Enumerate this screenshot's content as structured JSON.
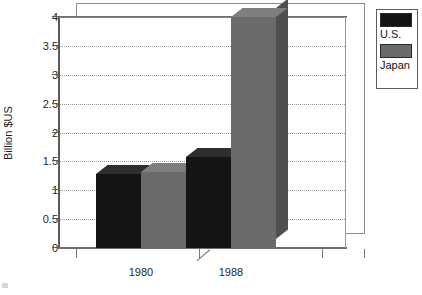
{
  "chart_data": {
    "type": "bar",
    "title": "",
    "subtitle": "",
    "xlabel": "",
    "ylabel": "Billion $US",
    "categories": [
      "1980",
      "1988"
    ],
    "series": [
      {
        "name": "U.S.",
        "color": "#141414",
        "values": [
          1.28,
          1.57
        ]
      },
      {
        "name": "Japan",
        "color": "#6b6b6b",
        "values": [
          1.32,
          4.0
        ]
      }
    ],
    "ylim": [
      0,
      4
    ],
    "ytick_values": [
      4,
      3.5,
      3,
      2.5,
      2,
      1.5,
      1,
      0.5,
      0
    ],
    "ytick_labels": [
      "4",
      "3.5",
      "3",
      "2.5",
      "2",
      "1.5",
      "1",
      "0.5",
      "0"
    ],
    "grid": true,
    "grid_axis": "y",
    "legend_position": "top-right",
    "three_d": true,
    "annotations": [
      "axis-break-mark"
    ]
  },
  "legend": {
    "entries": [
      {
        "label": "U.S.",
        "swatch_color": "#141414"
      },
      {
        "label": "Japan",
        "swatch_color": "#6b6b6b"
      }
    ]
  },
  "axes": {
    "y_title": "Billion $US",
    "x_categories": [
      "1980",
      "1988"
    ]
  },
  "colors": {
    "us_bar": "#141414",
    "japan_bar": "#6b6b6b",
    "japan_bar_side": "#4f4f4f",
    "japan_bar_top": "#7e7e7e",
    "us_bar_side": "#0a0a0a",
    "us_bar_top": "#2e2e2e",
    "frame": "#6f6f6f",
    "grid": "#9b9b9b",
    "background": "#ffffff",
    "text": "#1f1f1f"
  },
  "icons": {
    "break": "╱"
  }
}
